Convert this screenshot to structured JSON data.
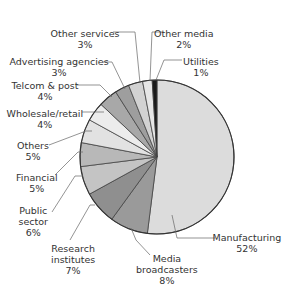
{
  "chart_data": {
    "type": "pie",
    "title": "",
    "start_angle_deg": 0,
    "direction": "clockwise",
    "categories": [
      "Manufacturing",
      "Media broadcasters",
      "Research institutes",
      "Public sector",
      "Financial",
      "Others",
      "Wholesale/retail",
      "Telcom & post",
      "Advertising agencies",
      "Other services",
      "Other media",
      "Utilities"
    ],
    "values": [
      52,
      8,
      7,
      6,
      5,
      5,
      4,
      4,
      3,
      3,
      2,
      1
    ],
    "labels": [
      "52%",
      "8%",
      "7%",
      "6%",
      "5%",
      "5%",
      "4%",
      "4%",
      "3%",
      "3%",
      "2%",
      "1%"
    ],
    "colors": [
      "#dcdcdc",
      "#9a9a9a",
      "#8f8f8f",
      "#c4c4c4",
      "#b8b8b8",
      "#e2e2e2",
      "#ececec",
      "#a8a8a8",
      "#9e9e9e",
      "#d2d2d2",
      "#e6e6e6",
      "#1a1a1a"
    ],
    "legend": "none (callout labels)"
  },
  "slices_labels": [
    {
      "name": "Manufacturing",
      "pct": "52%",
      "x": 247,
      "y": 232,
      "lx": [
        172,
        177,
        215
      ],
      "ly": [
        215,
        238,
        238
      ]
    },
    {
      "name": "Media broadcasters",
      "pct": "8%",
      "x": 167,
      "y": 253,
      "lx": [
        131,
        136,
        150
      ],
      "ly": [
        228,
        240,
        255
      ]
    },
    {
      "name": "Research institutes",
      "pct": "7%",
      "x": 73,
      "y": 243,
      "lx": [
        95,
        90,
        70
      ],
      "ly": [
        205,
        205,
        240
      ]
    },
    {
      "name": "Public sector",
      "pct": "6%",
      "x": 33,
      "y": 205,
      "lx": [
        83,
        75,
        52
      ],
      "ly": [
        176,
        176,
        212
      ]
    },
    {
      "name": "Financial",
      "pct": "5%",
      "x": 37,
      "y": 172,
      "lx": [
        83,
        78,
        55
      ],
      "ly": [
        152,
        152,
        175
      ]
    },
    {
      "name": "Others",
      "pct": "5%",
      "x": 33,
      "y": 140,
      "lx": [
        92,
        86,
        49
      ],
      "ly": [
        131,
        131,
        145
      ]
    },
    {
      "name": "Wholesale/retail",
      "pct": "4%",
      "x": 45,
      "y": 108,
      "lx": [
        104,
        96,
        82
      ],
      "ly": [
        112,
        112,
        112
      ]
    },
    {
      "name": "Telcom & post",
      "pct": "4%",
      "x": 45,
      "y": 80,
      "lx": [
        112,
        100,
        77
      ],
      "ly": [
        97,
        85,
        85
      ]
    },
    {
      "name": "Advertising agencies",
      "pct": "3%",
      "x": 59,
      "y": 56,
      "lx": [
        125,
        112,
        103
      ],
      "ly": [
        89,
        62,
        62
      ]
    },
    {
      "name": "Other services",
      "pct": "3%",
      "x": 85,
      "y": 28,
      "lx": [
        140,
        135,
        113
      ],
      "ly": [
        83,
        32,
        32
      ]
    },
    {
      "name": "Other media",
      "pct": "2%",
      "x": 184,
      "y": 28,
      "lx": [
        150,
        152,
        162
      ],
      "ly": [
        81,
        32,
        32
      ]
    },
    {
      "name": "Utilities",
      "pct": "1%",
      "x": 201,
      "y": 56,
      "lx": [
        156,
        164,
        182
      ],
      "ly": [
        80,
        60,
        60
      ]
    }
  ]
}
